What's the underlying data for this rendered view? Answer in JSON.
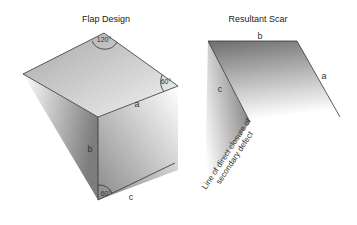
{
  "flap_design": {
    "title": "Flap Design",
    "angles": {
      "top": "120°",
      "right": "60°",
      "bottom": "60°"
    },
    "labels": {
      "a": "a",
      "b": "b",
      "c": "c"
    }
  },
  "resultant_scar": {
    "title": "Resultant Scar",
    "labels": {
      "a": "a",
      "b": "b",
      "c": "c"
    },
    "closure_line_line1": "Line of direct closure of",
    "closure_line_line2": "secondary defect"
  },
  "colors": {
    "shade_dark": "#7a7a7a",
    "shade_light": "#ffffff",
    "edge": "#333333"
  }
}
